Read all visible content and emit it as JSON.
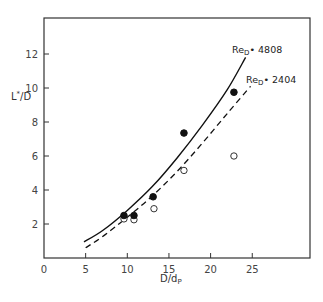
{
  "chart_data": {
    "type": "scatter",
    "title": "",
    "xlabel": "D/d",
    "xlabel_sub": "P",
    "ylabel": "L*/D",
    "xlim": [
      0,
      30
    ],
    "ylim": [
      0,
      14
    ],
    "xticks": [
      0,
      5,
      10,
      15,
      20,
      25
    ],
    "yticks": [
      2,
      4,
      6,
      8,
      10,
      12
    ],
    "grid": false,
    "legend": "none (curves labeled inline)",
    "series": [
      {
        "name": "Re_D = 4808 (data)",
        "marker": "filled-circle",
        "points": [
          [
            9.6,
            2.5
          ],
          [
            10.8,
            2.5
          ],
          [
            13.1,
            3.6
          ],
          [
            16.8,
            7.35
          ],
          [
            22.8,
            9.75
          ]
        ]
      },
      {
        "name": "Re_D = 2404 (data)",
        "marker": "open-circle",
        "points": [
          [
            9.6,
            2.3
          ],
          [
            10.8,
            2.25
          ],
          [
            13.2,
            2.9
          ],
          [
            16.8,
            5.15
          ],
          [
            22.8,
            6.0
          ]
        ]
      },
      {
        "name": "Re_D = 4808",
        "style": "solid-line",
        "points": [
          [
            4.8,
            0.95
          ],
          [
            7,
            1.6
          ],
          [
            10,
            2.8
          ],
          [
            13,
            4.2
          ],
          [
            16,
            5.9
          ],
          [
            19,
            7.8
          ],
          [
            22,
            9.9
          ],
          [
            24.2,
            11.8
          ]
        ]
      },
      {
        "name": "Re_D = 2404",
        "style": "dashed-line",
        "points": [
          [
            5,
            0.6
          ],
          [
            7,
            1.25
          ],
          [
            10,
            2.4
          ],
          [
            13,
            3.65
          ],
          [
            16,
            5.1
          ],
          [
            19,
            6.75
          ],
          [
            22,
            8.5
          ],
          [
            24.8,
            10.1
          ]
        ]
      }
    ],
    "annotations": [
      {
        "text_main": "Re",
        "text_sub": "D",
        "text_rest": " = 4808",
        "at": [
          22,
          12.6
        ]
      },
      {
        "text_main": "Re",
        "text_sub": "D",
        "text_rest": " = 2404",
        "at": [
          23.7,
          10.7
        ]
      }
    ]
  },
  "labels": {
    "x_main": "D/d",
    "x_sub": "P",
    "y_main": "L",
    "y_sup": "*",
    "y_rest": "/D",
    "re1_main": "Re",
    "re1_sub": "D",
    "re1_rest": "• 4808",
    "re2_main": "Re",
    "re2_sub": "D",
    "re2_rest": "• 2404"
  }
}
